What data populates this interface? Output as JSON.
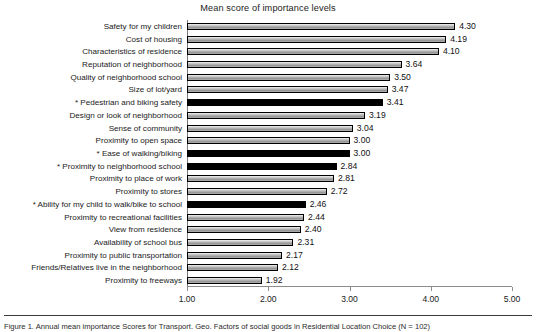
{
  "chart_data": {
    "type": "bar",
    "orientation": "horizontal",
    "title": "Mean score of importance levels",
    "xlabel": "",
    "ylabel": "",
    "xlim": [
      1.0,
      5.0
    ],
    "xticks": [
      "1.00",
      "2.00",
      "3.00",
      "4.00",
      "5.00"
    ],
    "xtick_values": [
      1.0,
      2.0,
      3.0,
      4.0,
      5.0
    ],
    "grid": false,
    "legend": "none",
    "categories": [
      "Safety for my children",
      "Cost of housing",
      "Characteristics of residence",
      "Reputation of neighborhood",
      "Quality of neighborhood school",
      "Size of lot/yard",
      "* Pedestrian and biking safety",
      "Design or look of neighborhood",
      "Sense of community",
      "Proximity to open space",
      "* Ease of walking/biking",
      "* Proximity to neighborhood school",
      "Proximity to place of work",
      "Proximity to stores",
      "* Ability for my child to walk/bike to school",
      "Proximity to recreational facilities",
      "View from residence",
      "Availability of school bus",
      "Proximity to public transportation",
      "Friends/Relatives live in the neighborhood",
      "Proximity to freeways"
    ],
    "values": [
      4.3,
      4.19,
      4.1,
      3.64,
      3.5,
      3.47,
      3.41,
      3.19,
      3.04,
      3.0,
      3.0,
      2.84,
      2.81,
      2.72,
      2.46,
      2.44,
      2.4,
      2.31,
      2.17,
      2.12,
      1.92
    ],
    "value_labels": [
      "4.30",
      "4.19",
      "4.10",
      "3.64",
      "3.50",
      "3.47",
      "3.41",
      "3.19",
      "3.04",
      "3.00",
      "3.00",
      "2.84",
      "2.81",
      "2.72",
      "2.46",
      "2.44",
      "2.40",
      "2.31",
      "2.17",
      "2.12",
      "1.92"
    ],
    "highlighted": [
      false,
      false,
      false,
      false,
      false,
      false,
      true,
      false,
      false,
      false,
      true,
      true,
      false,
      false,
      true,
      false,
      false,
      false,
      false,
      false,
      false
    ],
    "colors": {
      "bar_gray_fill": "#b4b4b4",
      "bar_highlight_fill": "#000000",
      "bar_border": "#000000",
      "axis": "#8c8c8c",
      "text": "#1a1a1a"
    }
  },
  "caption": {
    "rule": "",
    "text": "Figure 1.  Annual mean importance Scores for Transport. Geo. Factors of social goods in Residential Location Choice (N = 102)"
  }
}
